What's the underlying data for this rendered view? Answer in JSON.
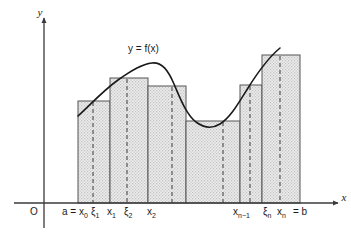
{
  "figure": {
    "kind": "riemann-sum-diagram",
    "title_text": "",
    "background": "#ffffff",
    "axes": {
      "origin_label": "O",
      "x_axis_label": "x",
      "y_axis_label": "y",
      "x_axis_y": 203,
      "y_axis_x": 44,
      "x_axis_start": 14,
      "x_axis_end": 338,
      "y_axis_top": 18,
      "y_axis_bottom": 228,
      "axis_color": "#3a3a3a"
    },
    "curve": {
      "label": "y  =  f(x)",
      "label_x": 128,
      "label_y": 52,
      "color": "#1a1a1a",
      "width": 1.6
    },
    "style": {
      "bar_fill": "#e3e3e3",
      "bar_stroke": "#555555",
      "dash_color": "#4a4a4a",
      "hatch_dot": "#bdbdbd"
    },
    "partition_label_y": 215
  },
  "chart_data": {
    "type": "area",
    "xlabel": "x",
    "ylabel": "y",
    "baseline_y": 203,
    "bars": [
      {
        "x0": 78,
        "x1": 110,
        "top": 101,
        "xi": 93
      },
      {
        "x0": 110,
        "x1": 148,
        "top": 78,
        "xi": 127
      },
      {
        "x0": 148,
        "x1": 186,
        "top": 86,
        "xi": 172
      },
      {
        "x0": 186,
        "x1": 240,
        "top": 121,
        "xi": 223
      },
      {
        "x0": 240,
        "x1": 262,
        "top": 85,
        "xi": 250
      },
      {
        "x0": 262,
        "x1": 300,
        "top": 55,
        "xi": 280
      }
    ],
    "curve_path": "M 78,116 C 92,103 104,90 118,80 C 132,70 142,64 152,63 C 162,62 168,70 174,84 C 180,98 186,114 196,122 C 204,128 212,129 220,124 C 230,118 238,104 248,88 C 258,72 268,58 280,48",
    "partition_labels": [
      {
        "text": "a = x",
        "sub": "0",
        "x": 62,
        "name": "label-a-x0"
      },
      {
        "text": "ξ",
        "sub": "1",
        "x": 91,
        "name": "label-xi1"
      },
      {
        "text": "x",
        "sub": "1",
        "x": 107,
        "name": "label-x1"
      },
      {
        "text": "ξ",
        "sub": "2",
        "x": 124,
        "name": "label-xi2"
      },
      {
        "text": "x",
        "sub": "2",
        "x": 147,
        "name": "label-x2"
      },
      {
        "text": "x",
        "sub": "n−1",
        "x": 233,
        "name": "label-xn-1"
      },
      {
        "text": "ξ",
        "sub": "n",
        "x": 263,
        "name": "label-xin"
      },
      {
        "text": "x",
        "sub": "n",
        "x": 277,
        "name": "label-xn"
      },
      {
        "text": "= b",
        "sub": "",
        "x": 293,
        "name": "label-equals-b"
      }
    ]
  }
}
